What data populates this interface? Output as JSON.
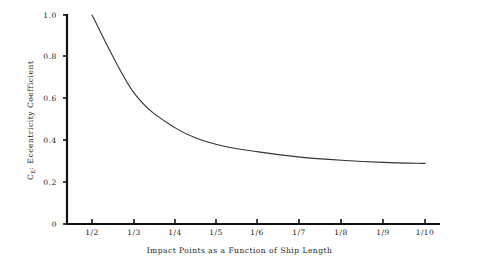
{
  "figure": {
    "background_color": "#ffffff",
    "axis_color": "#111111",
    "curve_color": "#333333"
  },
  "axes": {
    "y_title_prefix": "C",
    "y_title_subscript": "E",
    "y_title_rest": ": Eccentricity Coefficient",
    "y_title_full": "C_E: Eccentricity Coefficient",
    "x_title_part1": "Impact Points as a Function of",
    "x_title_part2": "Ship Length",
    "x_title_full": "Impact Points as a Function of Ship Length"
  },
  "y_ticks": [
    {
      "label": "0",
      "value": 0.0
    },
    {
      "label": "0.2",
      "value": 0.2
    },
    {
      "label": "0.4",
      "value": 0.4
    },
    {
      "label": "0.6",
      "value": 0.6
    },
    {
      "label": "0.8",
      "value": 0.8
    },
    {
      "label": "1.0",
      "value": 1.0
    }
  ],
  "x_ticks": [
    {
      "label": "1/2",
      "value": 2
    },
    {
      "label": "1/3",
      "value": 3
    },
    {
      "label": "1/4",
      "value": 4
    },
    {
      "label": "1/5",
      "value": 5
    },
    {
      "label": "1/6",
      "value": 6
    },
    {
      "label": "1/7",
      "value": 7
    },
    {
      "label": "1/8",
      "value": 8
    },
    {
      "label": "1/9",
      "value": 9
    },
    {
      "label": "1/10",
      "value": 10
    }
  ],
  "chart_data": {
    "type": "line",
    "title": "",
    "xlabel": "Impact Points as a Function of Ship Length",
    "ylabel": "C_E: Eccentricity Coefficient",
    "grid": false,
    "legend": "none",
    "x_tick_labels": [
      "1/2",
      "1/3",
      "1/4",
      "1/5",
      "1/6",
      "1/7",
      "1/8",
      "1/9",
      "1/10"
    ],
    "y_tick_labels": [
      "0",
      "0.2",
      "0.4",
      "0.6",
      "0.8",
      "1.0"
    ],
    "ylim": [
      0,
      1.0
    ],
    "series": [
      {
        "name": "Eccentricity Coefficient",
        "x": [
          "1/2",
          "1/3",
          "1/4",
          "1/5",
          "1/6",
          "1/7",
          "1/8",
          "1/9",
          "1/10"
        ],
        "values": [
          1.0,
          0.63,
          0.46,
          0.38,
          0.345,
          0.32,
          0.305,
          0.295,
          0.29
        ]
      }
    ]
  }
}
